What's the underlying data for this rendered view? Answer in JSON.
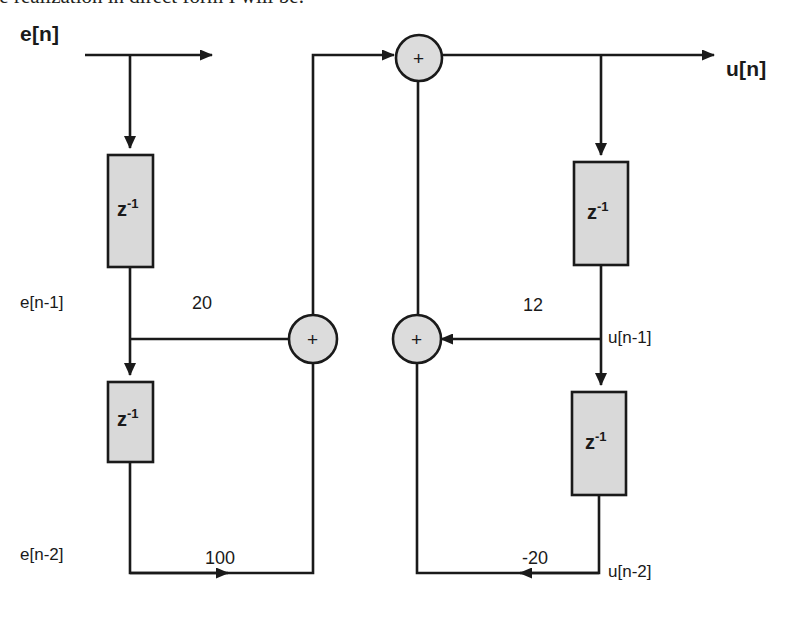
{
  "caption": {
    "text": "The realization in direct form I will be:"
  },
  "diagram": {
    "type": "signal-flow-block-diagram",
    "input_label": "e[n]",
    "output_label": "u[n]",
    "adder_symbol": "+",
    "delay_symbol": "z",
    "delay_exponent": "-1",
    "colors": {
      "line": "#1a1a1a",
      "block_fill": "#d9d9d9",
      "adder_fill": "#dcdcdc",
      "background": "#ffffff",
      "caption_text": "#231f20"
    },
    "taps": [
      {
        "id": "e_n1",
        "label": "e[n-1]"
      },
      {
        "id": "e_n2",
        "label": "e[n-2]"
      },
      {
        "id": "u_n1",
        "label": "u[n-1]"
      },
      {
        "id": "u_n2",
        "label": "u[n-2]"
      }
    ],
    "gains": [
      {
        "id": "b1",
        "label": "20",
        "path": "feedforward",
        "direction": "right",
        "source": "e[n-1]"
      },
      {
        "id": "b2",
        "label": "100",
        "path": "feedforward",
        "direction": "right",
        "source": "e[n-2]"
      },
      {
        "id": "a1",
        "label": "12",
        "path": "feedback",
        "direction": "left",
        "source": "u[n-1]"
      },
      {
        "id": "a2",
        "label": "-20",
        "path": "feedback",
        "direction": "left",
        "source": "u[n-2]"
      }
    ],
    "delay_blocks": [
      {
        "id": "dz1",
        "label": "z",
        "exponent": "-1",
        "side": "input",
        "order": 1
      },
      {
        "id": "dz2",
        "label": "z",
        "exponent": "-1",
        "side": "input",
        "order": 2
      },
      {
        "id": "dz3",
        "label": "z",
        "exponent": "-1",
        "side": "output",
        "order": 1
      },
      {
        "id": "dz4",
        "label": "z",
        "exponent": "-1",
        "side": "output",
        "order": 2
      }
    ],
    "adders": [
      {
        "id": "sum_top",
        "label": "+",
        "role": "output-summing-junction"
      },
      {
        "id": "sum_left",
        "label": "+",
        "role": "feedforward-summing-junction"
      },
      {
        "id": "sum_right",
        "label": "+",
        "role": "feedback-summing-junction"
      }
    ]
  }
}
